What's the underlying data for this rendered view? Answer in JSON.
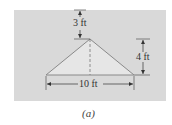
{
  "figure": {
    "caption": "(a)",
    "dimensions": {
      "apex_height": "3 ft",
      "side_height": "4 ft",
      "base_width": "10 ft"
    },
    "colors": {
      "panel": "#d9d9d9",
      "triangle_fill": "#e6e6e6",
      "line": "#7a7a7a"
    }
  }
}
